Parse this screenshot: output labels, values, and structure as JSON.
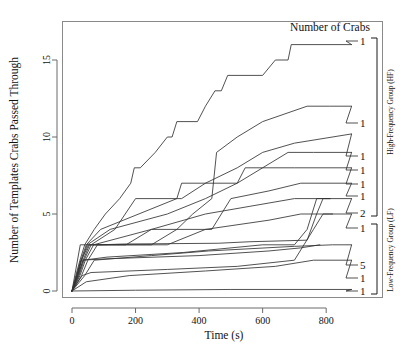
{
  "chart_data": {
    "type": "line",
    "title": "",
    "xlabel": "Time (s)",
    "ylabel": "Number of Templates Crabs Passed Through",
    "xlim": [
      0,
      940
    ],
    "ylim": [
      -0.6,
      17.6
    ],
    "xticks": [
      0,
      200,
      400,
      600,
      800
    ],
    "xtick_labels": [
      "0",
      "200",
      "400",
      "600",
      "800"
    ],
    "yticks": [
      0,
      5,
      10,
      15
    ],
    "ytick_labels": [
      "0",
      "5",
      "10",
      "15"
    ],
    "grid": false,
    "legend_position": "right-outside",
    "legend_title": "Number of Crabs",
    "groups": [
      {
        "name": "High-Frequency Group (HF)",
        "series_indices": [
          0,
          1,
          2,
          3,
          4,
          5,
          6
        ]
      },
      {
        "name": "Low-Frequency Group (LF)",
        "series_indices": [
          7,
          8,
          9,
          10
        ]
      }
    ],
    "series": [
      {
        "name": "HF-1",
        "crab_count_label": "1",
        "group": "High-Frequency Group (HF)",
        "end_label_y": 16,
        "points": [
          [
            0,
            0
          ],
          [
            12,
            1
          ],
          [
            25,
            2
          ],
          [
            40,
            3
          ],
          [
            70,
            4
          ],
          [
            105,
            5
          ],
          [
            150,
            6
          ],
          [
            185,
            7
          ],
          [
            196,
            8
          ],
          [
            215,
            8
          ],
          [
            262,
            9
          ],
          [
            300,
            10
          ],
          [
            315,
            10
          ],
          [
            330,
            11
          ],
          [
            395,
            11
          ],
          [
            420,
            12
          ],
          [
            450,
            13
          ],
          [
            470,
            13
          ],
          [
            490,
            14
          ],
          [
            600,
            14
          ],
          [
            640,
            15
          ],
          [
            680,
            15
          ],
          [
            690,
            16
          ],
          [
            812,
            16
          ],
          [
            880,
            16
          ]
        ]
      },
      {
        "name": "HF-2",
        "crab_count_label": "1",
        "group": "High-Frequency Group (HF)",
        "end_label_y": 12,
        "points": [
          [
            0,
            0
          ],
          [
            20,
            1
          ],
          [
            35,
            2
          ],
          [
            55,
            3
          ],
          [
            250,
            3
          ],
          [
            330,
            4
          ],
          [
            380,
            5
          ],
          [
            440,
            6
          ],
          [
            455,
            9
          ],
          [
            520,
            10
          ],
          [
            600,
            11
          ],
          [
            740,
            12
          ],
          [
            810,
            12
          ],
          [
            880,
            12
          ]
        ]
      },
      {
        "name": "HF-3",
        "crab_count_label": "1",
        "group": "High-Frequency Group (HF)",
        "end_label_y": 10.2,
        "points": [
          [
            0,
            0
          ],
          [
            15,
            1
          ],
          [
            28,
            2
          ],
          [
            45,
            3
          ],
          [
            90,
            4
          ],
          [
            330,
            6
          ],
          [
            345,
            6
          ],
          [
            420,
            7
          ],
          [
            520,
            8
          ],
          [
            600,
            9
          ],
          [
            700,
            9.6
          ],
          [
            880,
            10.2
          ]
        ]
      },
      {
        "name": "HF-4",
        "crab_count_label": "1",
        "group": "High-Frequency Group (HF)",
        "end_label_y": 9,
        "points": [
          [
            0,
            0
          ],
          [
            18,
            1
          ],
          [
            30,
            2
          ],
          [
            48,
            3
          ],
          [
            120,
            4
          ],
          [
            300,
            5
          ],
          [
            420,
            6
          ],
          [
            520,
            7
          ],
          [
            600,
            8
          ],
          [
            680,
            9
          ],
          [
            760,
            9
          ],
          [
            880,
            9
          ]
        ]
      },
      {
        "name": "HF-5",
        "crab_count_label": "1",
        "group": "High-Frequency Group (HF)",
        "end_label_y": 8,
        "points": [
          [
            0,
            0
          ],
          [
            22,
            1
          ],
          [
            38,
            2
          ],
          [
            60,
            3
          ],
          [
            135,
            4
          ],
          [
            200,
            6
          ],
          [
            330,
            6
          ],
          [
            345,
            7
          ],
          [
            520,
            7
          ],
          [
            545,
            8
          ],
          [
            700,
            8
          ],
          [
            880,
            8
          ]
        ]
      },
      {
        "name": "HF-6",
        "crab_count_label": "1",
        "group": "High-Frequency Group (HF)",
        "end_label_y": 7,
        "points": [
          [
            0,
            0
          ],
          [
            25,
            1
          ],
          [
            42,
            2
          ],
          [
            68,
            3
          ],
          [
            250,
            4
          ],
          [
            440,
            4
          ],
          [
            500,
            6
          ],
          [
            620,
            6.5
          ],
          [
            720,
            7
          ],
          [
            880,
            7
          ]
        ]
      },
      {
        "name": "HF-7",
        "crab_count_label": "2",
        "group": "High-Frequency Group (HF)",
        "end_label_y": 6,
        "points": [
          [
            0,
            0
          ],
          [
            16,
            1
          ],
          [
            30,
            2
          ],
          [
            52,
            3
          ],
          [
            170,
            3
          ],
          [
            250,
            4
          ],
          [
            420,
            5
          ],
          [
            560,
            5.5
          ],
          [
            700,
            6
          ],
          [
            880,
            6
          ]
        ]
      },
      {
        "name": "LF-1",
        "crab_count_label": "1",
        "group": "Low-Frequency Group (LF)",
        "end_label_y": 5,
        "points": [
          [
            0,
            0
          ],
          [
            30,
            1
          ],
          [
            50,
            2
          ],
          [
            80,
            3
          ],
          [
            300,
            3
          ],
          [
            420,
            4
          ],
          [
            620,
            4.6
          ],
          [
            720,
            5
          ],
          [
            810,
            5
          ],
          [
            880,
            5
          ]
        ]
      },
      {
        "name": "LF-2",
        "crab_count_label": "5",
        "group": "Low-Frequency Group (LF)",
        "end_label_y": 3,
        "points": [
          [
            0,
            0
          ],
          [
            40,
            1
          ],
          [
            70,
            2
          ],
          [
            250,
            2.3
          ],
          [
            430,
            2.6
          ],
          [
            700,
            2.9
          ],
          [
            820,
            3
          ],
          [
            880,
            3
          ]
        ]
      },
      {
        "name": "LF-3",
        "crab_count_label": "1",
        "group": "Low-Frequency Group (LF)",
        "end_label_y": 2,
        "points": [
          [
            0,
            0
          ],
          [
            45,
            0.6
          ],
          [
            180,
            1
          ],
          [
            420,
            1.3
          ],
          [
            640,
            1.6
          ],
          [
            760,
            2
          ],
          [
            880,
            2
          ]
        ]
      },
      {
        "name": "LF-4",
        "crab_count_label": "1",
        "group": "Low-Frequency Group (LF)",
        "end_label_y": 0,
        "points": [
          [
            0,
            0
          ],
          [
            200,
            0.05
          ],
          [
            500,
            0.1
          ],
          [
            880,
            0.1
          ]
        ]
      },
      {
        "name": "LF-5",
        "crab_count_label": "",
        "group": "Low-Frequency Group (LF)",
        "end_label_y": null,
        "points": [
          [
            0,
            0
          ],
          [
            35,
            2
          ],
          [
            110,
            2.2
          ],
          [
            350,
            2.5
          ],
          [
            600,
            3
          ],
          [
            700,
            3
          ],
          [
            740,
            4
          ],
          [
            770,
            6
          ],
          [
            812,
            6
          ]
        ]
      },
      {
        "name": "LF-6",
        "crab_count_label": "",
        "group": "Low-Frequency Group (LF)",
        "end_label_y": null,
        "points": [
          [
            0,
            0
          ],
          [
            26,
            3
          ],
          [
            90,
            3
          ],
          [
            160,
            3.05
          ],
          [
            460,
            3.1
          ],
          [
            560,
            3.2
          ],
          [
            740,
            3.3
          ],
          [
            770,
            5
          ],
          [
            790,
            6
          ],
          [
            812,
            6
          ]
        ]
      },
      {
        "name": "LF-7",
        "crab_count_label": "",
        "group": "Low-Frequency Group (LF)",
        "end_label_y": null,
        "points": [
          [
            0,
            0
          ],
          [
            32,
            1
          ],
          [
            60,
            1.2
          ],
          [
            300,
            1.4
          ],
          [
            520,
            1.6
          ],
          [
            700,
            2
          ],
          [
            730,
            3
          ],
          [
            760,
            4
          ],
          [
            790,
            5
          ],
          [
            820,
            5
          ]
        ]
      },
      {
        "name": "LF-8",
        "crab_count_label": "",
        "group": "Low-Frequency Group (LF)",
        "end_label_y": null,
        "points": [
          [
            0,
            0
          ],
          [
            28,
            2
          ],
          [
            120,
            2.1
          ],
          [
            400,
            2.3
          ],
          [
            620,
            2.6
          ],
          [
            720,
            2.8
          ],
          [
            780,
            3
          ]
        ]
      }
    ],
    "colors": {
      "line": "#333333",
      "axis": "#6b6b6b",
      "frame": "#8a8a8a",
      "text": "#111111",
      "background": "#ffffff"
    }
  },
  "labels": {
    "legend_title": "Number of Crabs",
    "x_axis_title": "Time (s)",
    "y_axis_title": "Number of Templates Crabs Passed Through",
    "group_hf": "High-Frequency Group (HF)",
    "group_lf": "Low-Frequency Group (LF)"
  }
}
